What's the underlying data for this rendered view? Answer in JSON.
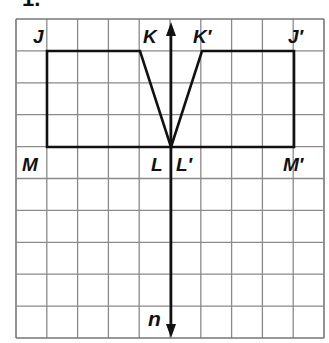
{
  "problem": {
    "number": "1."
  },
  "grid": {
    "left": 16,
    "top": 19,
    "cols": 10,
    "rows": 10,
    "cell_w": 30.8,
    "cell_h": 31.9,
    "line_color": "#8a8a8a",
    "border_color": "#777777"
  },
  "axis": {
    "name": "n",
    "x": 171,
    "y_top": 22,
    "y_bottom": 338,
    "color": "#111111"
  },
  "figures": {
    "original": {
      "name": "JKLM",
      "vertices": [
        {
          "label": "J",
          "x": 47,
          "y": 51
        },
        {
          "label": "K",
          "x": 140,
          "y": 51
        },
        {
          "label": "L",
          "x": 171,
          "y": 147
        },
        {
          "label": "M",
          "x": 47,
          "y": 147
        }
      ]
    },
    "image": {
      "name": "J'K'L'M'",
      "vertices": [
        {
          "label": "J′",
          "x": 294,
          "y": 51
        },
        {
          "label": "K′",
          "x": 202,
          "y": 51
        },
        {
          "label": "L′",
          "x": 171,
          "y": 147
        },
        {
          "label": "M′",
          "x": 294,
          "y": 147
        }
      ]
    },
    "stroke_color": "#111111"
  },
  "labels": {
    "J": "J",
    "K": "K",
    "L": "L",
    "M": "M",
    "J_prime": "J′",
    "K_prime": "K′",
    "L_prime": "L′",
    "M_prime": "M′",
    "n": "n"
  }
}
